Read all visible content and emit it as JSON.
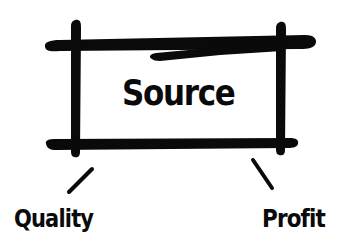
{
  "diagram": {
    "type": "hand-drawn concept diagram",
    "center_box": {
      "label": "Source"
    },
    "branches": [
      {
        "label": "Quality",
        "position": "bottom-left"
      },
      {
        "label": "Profit",
        "position": "bottom-right"
      }
    ],
    "colors": {
      "ink": "#0a0a0a",
      "background": "#ffffff"
    }
  }
}
